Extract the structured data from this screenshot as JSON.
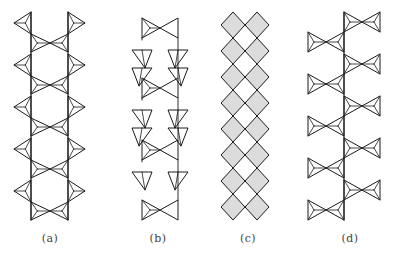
{
  "figure": {
    "stroke_color": "#1a1a1a",
    "hatch_color": "#888888",
    "background": "#ffffff"
  },
  "panels": [
    {
      "id": "a",
      "label": "(a)",
      "label_x": 50,
      "type": "double-chain-hexagonal",
      "left_spine_x": 31,
      "right_spine_x": 68,
      "outer_apex_offset": 17,
      "center_x": 50,
      "outer_y": [
        12,
        54,
        96,
        138,
        180
      ],
      "outer_h": 22,
      "cross_y": [
        43,
        85,
        127,
        169,
        211
      ],
      "cross_h": 18,
      "top_y": 12,
      "bottom_y": 220
    },
    {
      "id": "b",
      "label": "(b)",
      "label_x": 158,
      "type": "double-chain-zigzag",
      "left_spine_x": 142,
      "right_spine_x": 178,
      "center_x": 160,
      "cross_y": [
        28,
        88,
        150,
        210
      ],
      "cross_h": 20,
      "diamond_w": 20,
      "diamonds_left_y": [
        50,
        68,
        110,
        128,
        172
      ],
      "diamonds_right_y": [
        50,
        68,
        110,
        128,
        172
      ],
      "diamond_h": 18
    },
    {
      "id": "c",
      "label": "(c)",
      "label_x": 248,
      "type": "diamond-ladder",
      "center_x": 245,
      "half_w": 12,
      "top_y": 12,
      "diamond_h": 26,
      "count": 8
    },
    {
      "id": "d",
      "label": "(d)",
      "label_x": 350,
      "type": "branched-single-chain",
      "spine_x": 344,
      "right_centers_y": [
        22,
        64,
        106,
        148,
        190
      ],
      "left_centers_y": [
        42,
        84,
        126,
        168,
        210
      ],
      "bowtie_half_w": 18,
      "bowtie_half_h": 10
    }
  ]
}
